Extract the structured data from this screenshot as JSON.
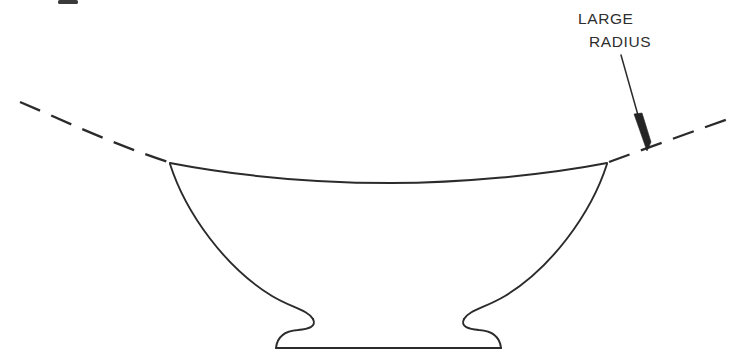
{
  "document": {
    "title": "Large Radius Bowl Profile Diagram",
    "background_color": "#ffffff",
    "ink_color": "#2b2b2b",
    "width": 753,
    "height": 363
  },
  "annotation": {
    "label_line_1": "LARGE",
    "label_line_2": "RADIUS",
    "label_full": "LARGE RADIUS",
    "text_color": "#2e2e2e",
    "line_1_x": 578,
    "line_1_y": 24,
    "line_2_x": 589,
    "line_2_y": 47,
    "leader": {
      "start_x": 621,
      "start_y": 55,
      "end_x": 647,
      "end_y": 149,
      "arrowhead_points": "647,151 634,114 642,113 651,142",
      "color": "#242424"
    }
  },
  "radius_arc": {
    "description": "large radius construction arc through the bowl rim",
    "dashed_left_path": "M 20,102 C 58,118 110,143 168,162",
    "solid_rim_path": "M 170,163 C 243,177 320,183 391,183 C 460,183 545,175 607,163",
    "dashed_right_path": "M 609,162 C 650,147 694,131 731,118",
    "dash_pattern": "22 12",
    "stroke_color": "#2b2b2b"
  },
  "vessel": {
    "name": "footed bowl cross-section",
    "left_rim_corner_x": 170,
    "left_rim_corner_y": 163,
    "right_rim_corner_x": 607,
    "right_rim_corner_y": 163,
    "rim_low_point_x": 391,
    "rim_low_point_y": 183,
    "waist_left_x": 313,
    "waist_right_x": 465,
    "waist_y": 318,
    "base_left_x": 276,
    "base_right_x": 502,
    "base_bottom_y": 348,
    "left_wall_path": "M 170,164 C 186,214 226,268 272,296 C 292,308 308,310 313,319",
    "right_wall_path": "M 607,164 C 591,214 551,268 505,296 C 485,308 469,310 464,319",
    "left_foot_path": "M 313,319 C 317,327 308,329 298,330 C 284,331 277,338 276,348",
    "right_foot_path": "M 464,319 C 460,327 469,329 479,330 C 493,331 500,338 501,348",
    "base_bottom_path": "M 276,348 L 501,348"
  },
  "artifact": {
    "name": "scan edge mark",
    "x": 58,
    "y": 0,
    "width": 20,
    "height": 4,
    "color": "#3a3a3a"
  }
}
